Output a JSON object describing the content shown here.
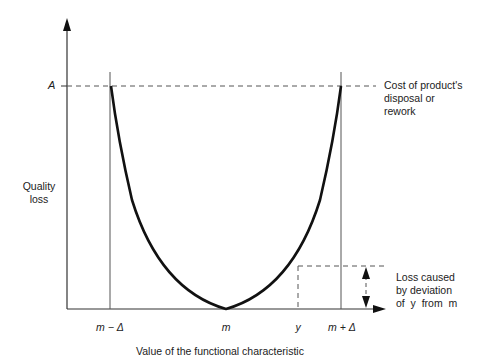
{
  "diagram": {
    "y_axis_label": [
      "Quality",
      "loss"
    ],
    "x_axis_label": "Value of the functional characteristic",
    "y_tick": "A",
    "x_ticks": {
      "lower_limit": "m − Δ",
      "target": "m",
      "value": "y",
      "upper_limit": "m + Δ"
    },
    "annotations": {
      "cost": [
        "Cost of product's",
        "disposal or",
        "rework"
      ],
      "loss": [
        "Loss caused",
        "by deviation",
        "of  y  from  m"
      ]
    },
    "colors": {
      "curve": "#111111",
      "axis": "#333333",
      "dashed": "#555555"
    }
  }
}
